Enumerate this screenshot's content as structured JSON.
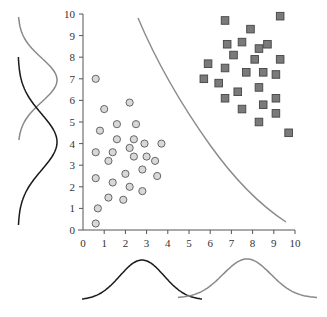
{
  "chart_data": {
    "type": "scatter",
    "title": "",
    "xlabel": "",
    "ylabel": "",
    "xlim": [
      0,
      10
    ],
    "ylim": [
      0,
      10
    ],
    "x_ticks": [
      "0",
      "1",
      "2",
      "3",
      "4",
      "5",
      "6",
      "7",
      "8",
      "9",
      "10"
    ],
    "y_ticks": [
      "0",
      "1",
      "2",
      "3",
      "4",
      "5",
      "6",
      "7",
      "8",
      "9",
      "10"
    ],
    "grid": false,
    "series": [
      {
        "name": "class-circles",
        "marker": "circle",
        "color": "#d8d8d8",
        "points": [
          [
            0.6,
            7.0
          ],
          [
            1.0,
            5.6
          ],
          [
            2.2,
            5.9
          ],
          [
            0.8,
            4.6
          ],
          [
            1.6,
            4.9
          ],
          [
            2.5,
            4.9
          ],
          [
            1.6,
            4.2
          ],
          [
            2.4,
            4.2
          ],
          [
            2.9,
            4.0
          ],
          [
            3.7,
            4.0
          ],
          [
            0.6,
            3.6
          ],
          [
            1.4,
            3.6
          ],
          [
            2.2,
            3.8
          ],
          [
            2.4,
            3.4
          ],
          [
            3.0,
            3.4
          ],
          [
            3.4,
            3.2
          ],
          [
            1.2,
            3.2
          ],
          [
            2.8,
            2.8
          ],
          [
            2.0,
            2.6
          ],
          [
            3.5,
            2.5
          ],
          [
            0.6,
            2.4
          ],
          [
            1.4,
            2.2
          ],
          [
            2.2,
            2.0
          ],
          [
            2.8,
            1.8
          ],
          [
            1.2,
            1.5
          ],
          [
            1.9,
            1.4
          ],
          [
            0.7,
            1.0
          ],
          [
            0.6,
            0.3
          ]
        ]
      },
      {
        "name": "class-squares",
        "marker": "square",
        "color": "#7a7a7a",
        "points": [
          [
            9.3,
            9.9
          ],
          [
            6.7,
            9.7
          ],
          [
            7.9,
            9.3
          ],
          [
            6.8,
            8.6
          ],
          [
            7.5,
            8.7
          ],
          [
            8.3,
            8.4
          ],
          [
            8.7,
            8.6
          ],
          [
            7.1,
            8.1
          ],
          [
            8.1,
            7.9
          ],
          [
            9.3,
            7.9
          ],
          [
            5.9,
            7.7
          ],
          [
            6.7,
            7.5
          ],
          [
            7.7,
            7.3
          ],
          [
            8.5,
            7.3
          ],
          [
            9.1,
            7.2
          ],
          [
            5.7,
            7.0
          ],
          [
            6.4,
            6.8
          ],
          [
            7.3,
            6.4
          ],
          [
            8.3,
            6.6
          ],
          [
            6.7,
            6.1
          ],
          [
            9.1,
            6.1
          ],
          [
            8.5,
            5.8
          ],
          [
            7.5,
            5.6
          ],
          [
            9.1,
            5.4
          ],
          [
            8.3,
            5.0
          ],
          [
            9.7,
            4.5
          ]
        ]
      }
    ],
    "decision_boundary": {
      "description": "curved separating line",
      "color": "#8a8a8a"
    },
    "marginals": {
      "x_axis": [
        {
          "name": "circles-x-distribution",
          "color": "#1a1a1a",
          "peak_x": 2.8
        },
        {
          "name": "squares-x-distribution",
          "color": "#8a8a8a",
          "peak_x": 7.8
        }
      ],
      "y_axis": [
        {
          "name": "squares-y-distribution",
          "color": "#8a8a8a",
          "peak_y": 7.0
        },
        {
          "name": "circles-y-distribution",
          "color": "#1a1a1a",
          "peak_y": 4.0
        }
      ]
    }
  }
}
